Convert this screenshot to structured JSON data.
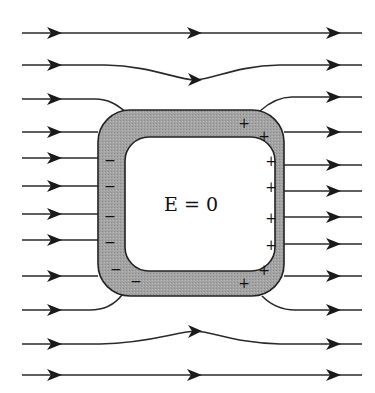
{
  "diagram": {
    "center_label": "E = 0",
    "colors": {
      "line": "#2a2a2a",
      "arrow": "#1a1a1a",
      "conductor_fill": "#9a9a9a",
      "conductor_stroke": "#222222",
      "cavity_fill": "#ffffff"
    },
    "charges": {
      "negative_symbol": "−",
      "positive_symbol": "+",
      "negative": [
        {
          "x": 110,
          "y": 160
        },
        {
          "x": 110,
          "y": 187
        },
        {
          "x": 110,
          "y": 217
        },
        {
          "x": 110,
          "y": 243
        },
        {
          "x": 116,
          "y": 271
        },
        {
          "x": 135,
          "y": 283
        }
      ],
      "positive": [
        {
          "x": 244,
          "y": 123
        },
        {
          "x": 264,
          "y": 135
        },
        {
          "x": 271,
          "y": 161
        },
        {
          "x": 271,
          "y": 187
        },
        {
          "x": 271,
          "y": 218
        },
        {
          "x": 271,
          "y": 245
        },
        {
          "x": 264,
          "y": 270
        },
        {
          "x": 244,
          "y": 283
        }
      ]
    },
    "field_lines_count": 12
  }
}
